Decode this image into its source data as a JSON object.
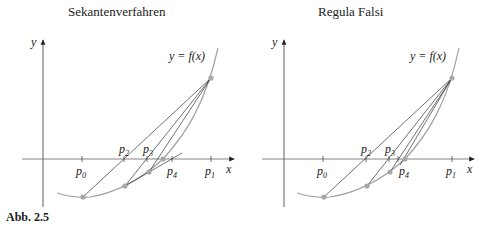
{
  "figure": {
    "caption": "Abb. 2.5",
    "panels": [
      {
        "title": "Sekantenverfahren",
        "y_axis_label": "y",
        "x_axis_label": "x",
        "curve_label": "y = f(x)",
        "points": [
          "p0",
          "p1",
          "p2",
          "p3",
          "p4"
        ]
      },
      {
        "title": "Regula Falsi",
        "y_axis_label": "y",
        "x_axis_label": "x",
        "curve_label": "y = f(x)",
        "points": [
          "p0",
          "p1",
          "p2",
          "p3",
          "p4"
        ]
      }
    ],
    "colors": {
      "curve": "#a0a0a0",
      "points": "#a8a8a8",
      "lines": "#333333"
    }
  }
}
